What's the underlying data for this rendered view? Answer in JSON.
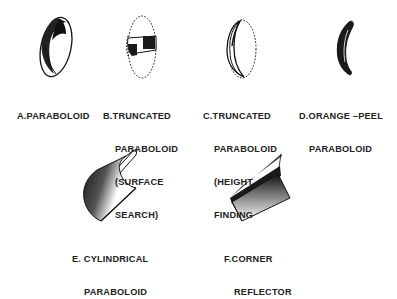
{
  "diagram": {
    "figures": [
      {
        "id": "A",
        "shape": "paraboloid",
        "lines": [
          "A.PARABOLOID"
        ]
      },
      {
        "id": "B",
        "shape": "truncated-paraboloid-surface-search",
        "lines": [
          "B.TRUNCATED",
          "PARABOLOID",
          "(SURFACE",
          "SEARCH)"
        ]
      },
      {
        "id": "C",
        "shape": "truncated-paraboloid-height-finding",
        "lines": [
          "C.TRUNCATED",
          "PARABOLOID",
          "(HEIGHT",
          "FINDING"
        ]
      },
      {
        "id": "D",
        "shape": "orange-peel-paraboloid",
        "lines": [
          "D.ORANGE –PEEL",
          "PARABOLOID"
        ]
      },
      {
        "id": "E",
        "shape": "cylindrical-paraboloid",
        "lines": [
          "E. CYLINDRICAL",
          "PARABOLOID"
        ]
      },
      {
        "id": "F",
        "shape": "corner-reflector",
        "lines": [
          "F.CORNER",
          "REFLECTOR"
        ]
      }
    ],
    "colors": {
      "ink": "#1a1a1a",
      "background": "#ffffff"
    }
  }
}
